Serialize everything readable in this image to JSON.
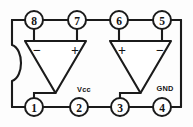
{
  "diagram": {
    "type": "schematic",
    "package": {
      "name": "8-pin DIP outline",
      "notch": "pin-1-notch-semicircle",
      "outline_color": "#1b1b1b",
      "background_color": "#ffffff"
    },
    "pins": [
      {
        "id": "pin-8",
        "number": "8",
        "side": "top",
        "cx": 34,
        "cy": 20
      },
      {
        "id": "pin-7",
        "number": "7",
        "side": "top",
        "cx": 77,
        "cy": 20
      },
      {
        "id": "pin-6",
        "number": "6",
        "side": "top",
        "cx": 119,
        "cy": 20
      },
      {
        "id": "pin-5",
        "number": "5",
        "side": "top",
        "cx": 162,
        "cy": 20
      },
      {
        "id": "pin-1",
        "number": "1",
        "side": "bottom",
        "cx": 34,
        "cy": 107
      },
      {
        "id": "pin-2",
        "number": "2",
        "side": "bottom",
        "cx": 79,
        "cy": 107
      },
      {
        "id": "pin-3",
        "number": "3",
        "side": "bottom",
        "cx": 120,
        "cy": 107
      },
      {
        "id": "pin-4",
        "number": "4",
        "side": "bottom",
        "cx": 162,
        "cy": 107
      }
    ],
    "amplifiers": [
      {
        "id": "amp-left",
        "name": "left-op-amp",
        "inverting_input_label": "−",
        "noninverting_input_label": "+",
        "inverting_input_pin": "8",
        "noninverting_input_pin": "7",
        "output_pin": "1"
      },
      {
        "id": "amp-right",
        "name": "right-op-amp",
        "noninverting_input_label": "+",
        "inverting_input_label": "−",
        "noninverting_input_pin": "6",
        "inverting_input_pin": "5",
        "output_pin": "3"
      }
    ],
    "rail_labels": [
      {
        "id": "vcc-label",
        "text": "Vcc",
        "x": 84,
        "y": 89,
        "pin": "2"
      },
      {
        "id": "gnd-label",
        "text": "GND",
        "x": 165,
        "y": 88,
        "pin": "4"
      }
    ]
  }
}
